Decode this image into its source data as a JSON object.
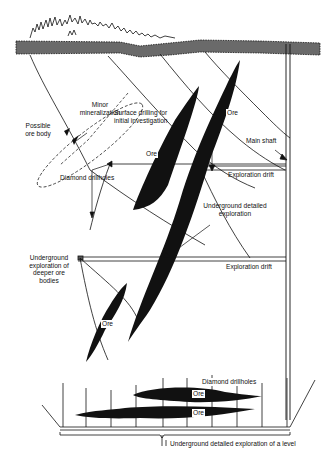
{
  "labels": {
    "minor_mineralization_1": "Minor",
    "minor_mineralization_2": "mineralization",
    "surface_drilling_1": "Surface drilling for",
    "surface_drilling_2": "initial investigation",
    "possible_ore_1": "Possible",
    "possible_ore_2": "ore body",
    "ore_upper_right": "Ore",
    "ore_upper_left": "Ore",
    "main_shaft": "Main shaft",
    "exploration_drift_1": "Exploration drift",
    "diamond_drillholes_1": "Diamond drillholes",
    "underground_detailed_1": "Underground detailed",
    "underground_detailed_2": "exploration",
    "exploration_drift_2": "Exploration drift",
    "deeper_1": "Underground",
    "deeper_2": "exploration of",
    "deeper_3": "deeper ore",
    "deeper_4": "bodies",
    "ore_lower": "Ore",
    "diamond_drillholes_2": "Diamond drillholes",
    "ore_level_top": "Ore",
    "ore_level_bottom": "Ore",
    "level_exploration": "Underground detailed exploration of a level"
  },
  "colors": {
    "ink": "#111111",
    "background": "#ffffff"
  }
}
